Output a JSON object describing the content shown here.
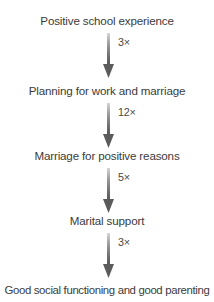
{
  "diagram": {
    "type": "flowchart",
    "orientation": "vertical",
    "title": "",
    "text_color": "#3b3b3b",
    "arrow_color_top": "#c9c9c9",
    "arrow_color_bottom": "#5a5a5a",
    "background": "#ffffff",
    "nodes": [
      {
        "id": "n1",
        "label": "Positive school experience"
      },
      {
        "id": "n2",
        "label": "Planning for work and marriage"
      },
      {
        "id": "n3",
        "label": "Marriage for positive reasons"
      },
      {
        "id": "n4",
        "label": "Marital support"
      },
      {
        "id": "n5",
        "label": "Good social functioning and good parenting"
      }
    ],
    "edges": [
      {
        "from": "n1",
        "to": "n2",
        "label": "3×",
        "icon": "down-arrow-icon"
      },
      {
        "from": "n2",
        "to": "n3",
        "label": "12×",
        "icon": "down-arrow-icon"
      },
      {
        "from": "n3",
        "to": "n4",
        "label": "5×",
        "icon": "down-arrow-icon"
      },
      {
        "from": "n4",
        "to": "n5",
        "label": "3×",
        "icon": "down-arrow-icon"
      }
    ]
  }
}
